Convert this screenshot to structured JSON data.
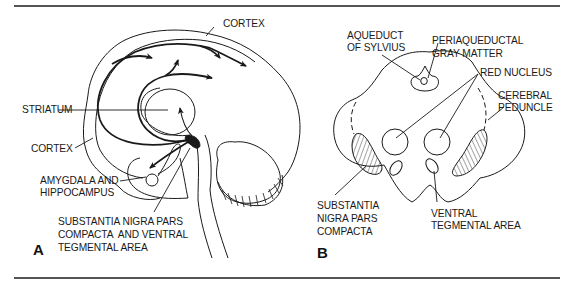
{
  "figure": {
    "panels": [
      {
        "letter": "A",
        "view": "sagittal brain section",
        "labels": {
          "cortex_top": "CORTEX",
          "striatum": "STRIATUM",
          "cortex_left": "CORTEX",
          "amygdala_1": "AMYGDALA AND",
          "amygdala_2": "HIPPOCAMPUS",
          "substantia_1": "SUBSTANTIA NIGRA PARS",
          "substantia_2": "COMPACTA  AND VENTRAL",
          "substantia_3": "TEGMENTAL AREA"
        }
      },
      {
        "letter": "B",
        "view": "midbrain cross-section",
        "labels": {
          "aqueduct_1": "AQUEDUCT",
          "aqueduct_2": "OF SYLVIUS",
          "periaqueductal_1": "PERIAQUEDUCTAL",
          "periaqueductal_2": "GRAY MATTER",
          "red_nucleus": "RED NUCLEUS",
          "cerebral_1": "CEREBRAL",
          "cerebral_2": "PEDUNCLE",
          "snpc_1": "SUBSTANTIA",
          "snpc_2": "NIGRA PARS",
          "snpc_3": "COMPACTA",
          "vta_1": "VENTRAL",
          "vta_2": "TEGMENTAL AREA"
        }
      }
    ],
    "colors": {
      "line": "#1a1a1a",
      "rule": "#555555",
      "background": "#ffffff"
    }
  }
}
